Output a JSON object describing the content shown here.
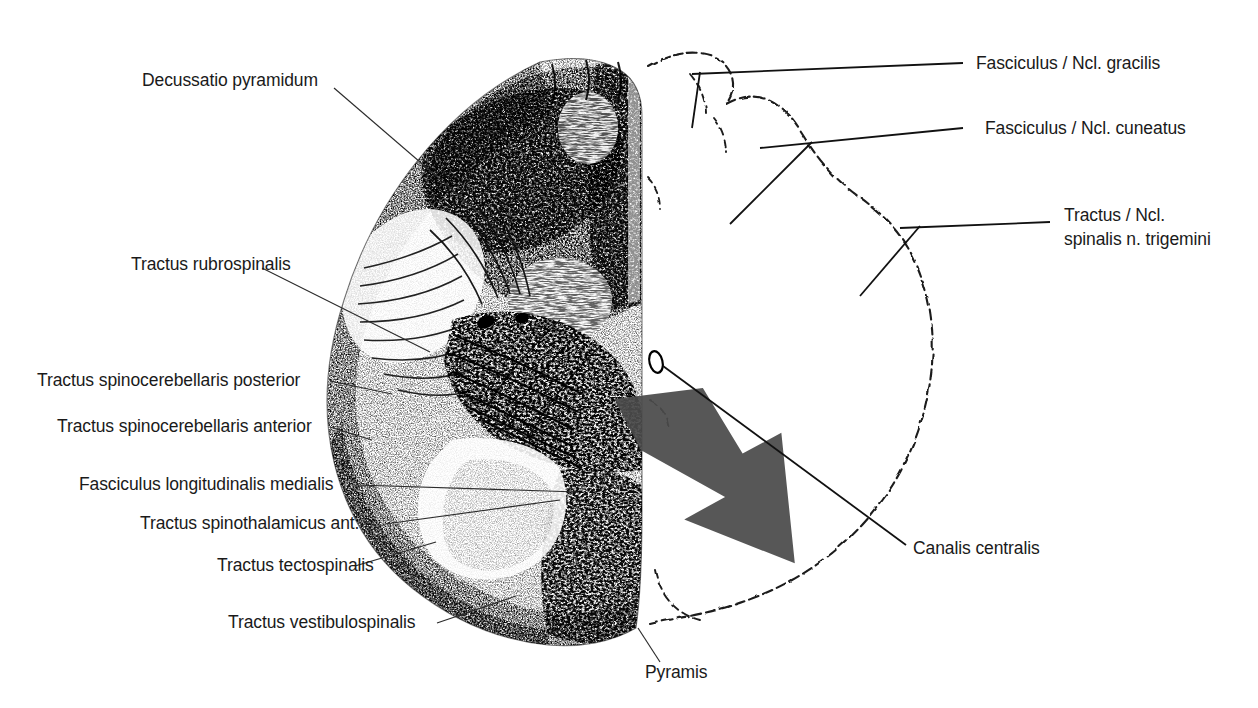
{
  "figure": {
    "type": "anatomical-histology-diagram",
    "background_color": "#ffffff",
    "ink_color": "#1a1a1a",
    "arrow_color": "#4a4a4a"
  },
  "labels_left": [
    {
      "id": "decussatio-pyramidum",
      "text": "Decussatio pyramidum"
    },
    {
      "id": "tractus-rubrospinalis",
      "text": "Tractus rubrospinalis"
    },
    {
      "id": "tractus-spinocerebellaris-posterior",
      "text": "Tractus spinocerebellaris posterior"
    },
    {
      "id": "tractus-spinocerebellaris-anterior",
      "text": "Tractus spinocerebellaris anterior"
    },
    {
      "id": "fasciculus-longitudinalis-medialis",
      "text": "Fasciculus longitudinalis medialis"
    },
    {
      "id": "tractus-spinothalamicus-ant",
      "text": "Tractus spinothalamicus ant."
    },
    {
      "id": "tractus-tectospinalis",
      "text": "Tractus tectospinalis"
    },
    {
      "id": "tractus-vestibulospinalis",
      "text": "Tractus vestibulospinalis"
    }
  ],
  "labels_right": [
    {
      "id": "fasciculus-ncl-gracilis",
      "text": "Fasciculus / Ncl. gracilis"
    },
    {
      "id": "fasciculus-ncl-cuneatus",
      "text": "Fasciculus / Ncl. cuneatus"
    },
    {
      "id": "tractus-ncl-spinalis-trigemini-line1",
      "text": "Tractus / Ncl."
    },
    {
      "id": "tractus-ncl-spinalis-trigemini-line2",
      "text": "spinalis  n. trigemini"
    },
    {
      "id": "canalis-centralis",
      "text": "Canalis centralis"
    }
  ],
  "labels_bottom": [
    {
      "id": "pyramis",
      "text": "Pyramis"
    }
  ]
}
